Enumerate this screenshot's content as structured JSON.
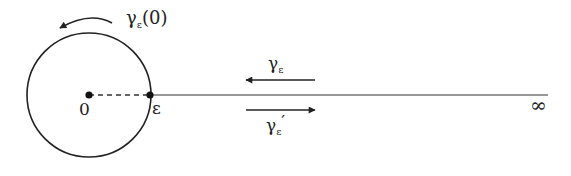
{
  "diagram": {
    "colors": {
      "stroke": "#222222",
      "background": "#ffffff"
    },
    "circle": {
      "cx": 89,
      "cy": 95,
      "r": 62
    },
    "points": {
      "origin": {
        "label": "0",
        "x": 89,
        "y": 95
      },
      "epsilon": {
        "label": "ε",
        "x": 150,
        "y": 95
      }
    },
    "ray": {
      "x1": 150,
      "x2": 548,
      "y": 95
    },
    "labels": {
      "circle_path": "γ",
      "circle_path_sub": "ε",
      "circle_path_arg": "(0)",
      "upper_path": "γ",
      "upper_path_sub": "ε",
      "lower_path": "γ",
      "lower_path_sub": "ε",
      "lower_path_prime": "′",
      "infinity": "∞"
    },
    "arrows": {
      "circle": "counterclockwise",
      "upper": "left",
      "lower": "right"
    }
  }
}
